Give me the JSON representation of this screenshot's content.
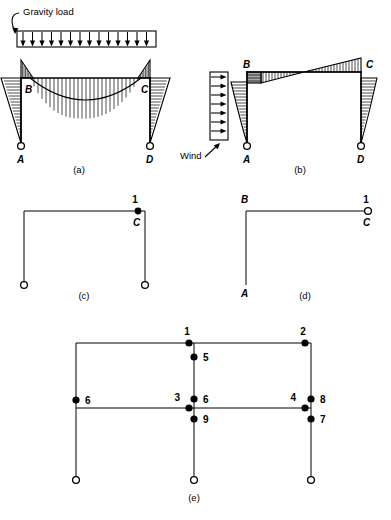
{
  "figure": {
    "panels": [
      {
        "id": "a",
        "caption": "(a)",
        "load_label": "Gravity load",
        "load_type": "uniform-distributed-downward",
        "load_arrow_count": 14,
        "joint_labels": [
          "B",
          "C"
        ],
        "support_labels": [
          "A",
          "D"
        ],
        "description": "Portal frame bending moment diagram under gravity load"
      },
      {
        "id": "b",
        "caption": "(b)",
        "load_label": "Wind",
        "load_type": "uniform-distributed-lateral",
        "load_arrow_count": 7,
        "joint_labels": [
          "B",
          "C"
        ],
        "support_labels": [
          "A",
          "D"
        ],
        "description": "Portal frame bending moment diagram under wind load"
      },
      {
        "id": "c",
        "caption": "(c)",
        "node_numbers": [
          "1"
        ],
        "joint_labels": [
          "C"
        ],
        "description": "Released portal frame with single degree of freedom at joint C"
      },
      {
        "id": "d",
        "caption": "(d)",
        "node_numbers": [
          "1"
        ],
        "joint_labels": [
          "A",
          "B",
          "C"
        ],
        "description": "Released L-frame with hinge at C"
      },
      {
        "id": "e",
        "caption": "(e)",
        "description": "Two-bay frame with numbered degrees of freedom",
        "node_numbers": {
          "top_center_joint": "1",
          "top_right_joint": "2",
          "mid_center_joint": "3",
          "mid_right_joint": "4",
          "center_upper_column": "5",
          "center_mid_column": "6",
          "left_mid_column": "6",
          "right_lower_column": "7",
          "right_upper_column": "8",
          "center_lower_column": "9"
        }
      }
    ]
  }
}
